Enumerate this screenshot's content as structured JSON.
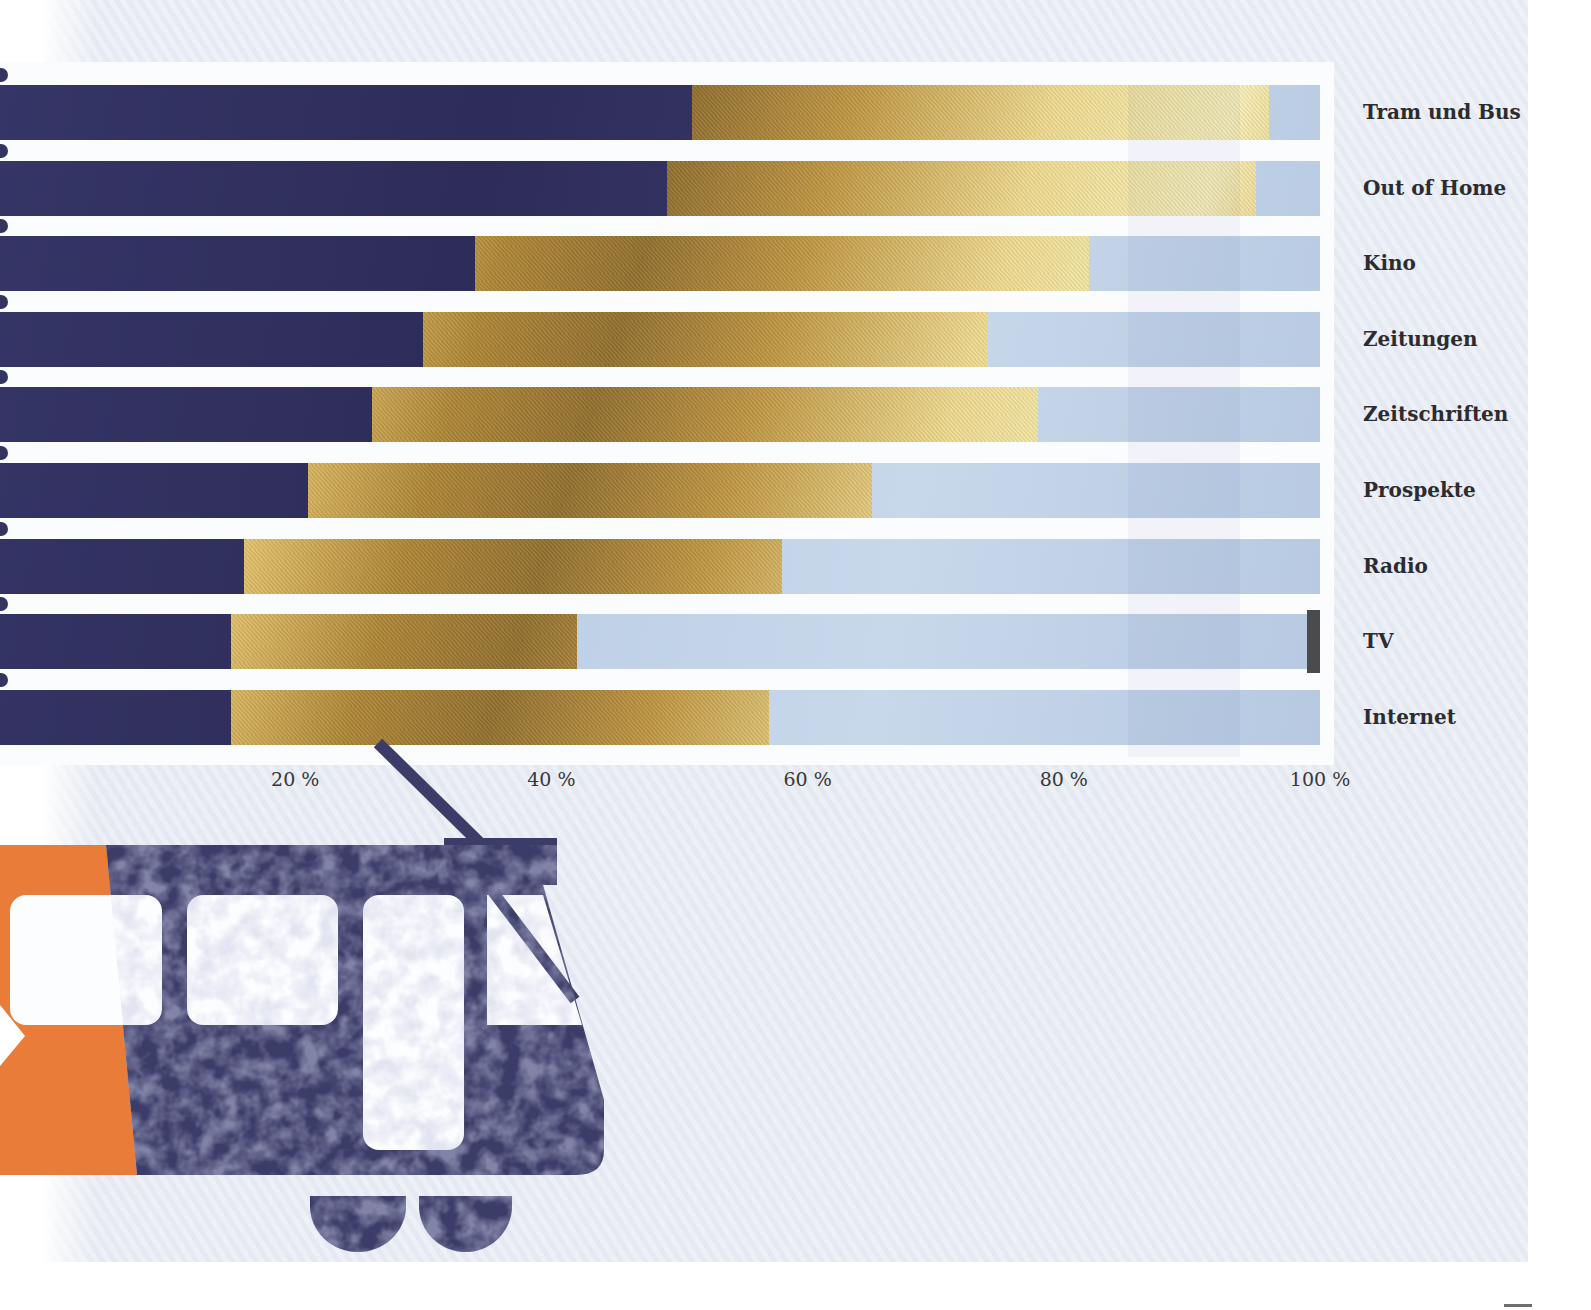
{
  "chart_data": {
    "type": "bar",
    "orientation": "horizontal",
    "stacked": true,
    "title": "",
    "xlabel": "",
    "ylabel": "",
    "xlim": [
      0,
      100
    ],
    "grid": false,
    "legend": "none",
    "categories": [
      "Tram und Bus",
      "Out of Home",
      "Kino",
      "Zeitungen",
      "Zeitschriften",
      "Prospekte",
      "Radio",
      "TV",
      "Internet"
    ],
    "series": [
      {
        "name": "segment-dark-navy",
        "color": "#31315f",
        "values": [
          51,
          49,
          34,
          30,
          26,
          21,
          16,
          15,
          15
        ]
      },
      {
        "name": "segment-gold",
        "color": "#d3ab52",
        "values": [
          45,
          46,
          48,
          44,
          52,
          44,
          42,
          27,
          42
        ]
      },
      {
        "name": "segment-light-blue",
        "color": "#bdd0e6",
        "values": [
          4,
          5,
          18,
          26,
          22,
          35,
          42,
          57,
          43
        ]
      },
      {
        "name": "segment-dark-gray",
        "color": "#4b4b4d",
        "values": [
          0,
          0,
          0,
          0,
          0,
          0,
          0,
          1,
          0
        ]
      }
    ],
    "x_ticks": [
      {
        "value": 20,
        "label": "20 %"
      },
      {
        "value": 40,
        "label": "40 %"
      },
      {
        "value": 60,
        "label": "60 %"
      },
      {
        "value": 80,
        "label": "80 %"
      },
      {
        "value": 100,
        "label": "100 %"
      }
    ]
  },
  "page": {
    "background_color": "#e9edf4",
    "gap_color": "#fbfcfe",
    "text_color": "#2c2c30"
  },
  "tram": {
    "name": "tram-icon",
    "body_color": "#3b3c68",
    "front_color": "#e87c38"
  }
}
